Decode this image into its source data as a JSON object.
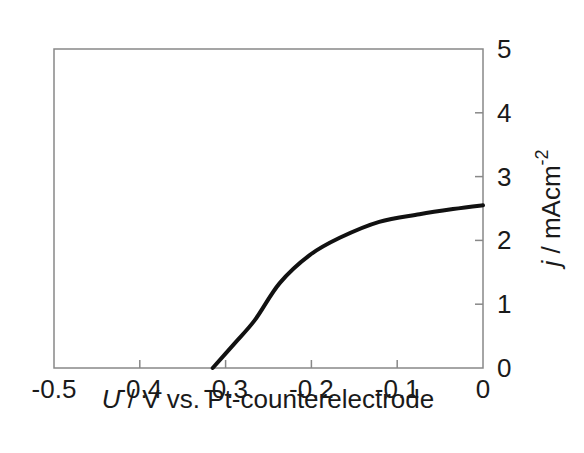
{
  "chart_data": {
    "type": "line",
    "title": "",
    "xlabel": "U / V vs. Pt-counterelectrode",
    "xlabel_parts": {
      "var": "U",
      "rest": " / V vs. Pt-counterelectrode"
    },
    "ylabel": "j / mAcm-2",
    "ylabel_parts": {
      "var": "j",
      "rest": " / mAcm",
      "sup": "-2"
    },
    "xlim": [
      -0.5,
      0
    ],
    "ylim": [
      0,
      5
    ],
    "xticks": [
      -0.5,
      -0.4,
      -0.3,
      -0.2,
      -0.1,
      0
    ],
    "xtick_labels": [
      "-0.5",
      "-0.4",
      "-0.3",
      "-0.2",
      "-0.1",
      "0"
    ],
    "yticks": [
      0,
      1,
      2,
      3,
      4,
      5
    ],
    "ytick_labels": [
      "0",
      "1",
      "2",
      "3",
      "4",
      "5"
    ],
    "y_axis_position": "right",
    "grid": false,
    "legend": null,
    "series": [
      {
        "name": "j-U curve",
        "color": "#111111",
        "x": [
          -0.315,
          -0.29,
          -0.266,
          -0.237,
          -0.202,
          -0.167,
          -0.121,
          -0.074,
          -0.035,
          0.0
        ],
        "y": [
          0.0,
          0.38,
          0.75,
          1.33,
          1.77,
          2.04,
          2.29,
          2.41,
          2.49,
          2.55
        ]
      }
    ]
  }
}
